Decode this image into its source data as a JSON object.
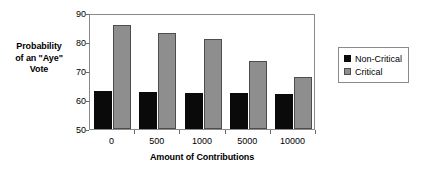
{
  "chart_data": {
    "type": "bar",
    "title": "",
    "xlabel": "Amount of Contributions",
    "ylabel": "Probability of an \"Aye\" Vote",
    "ylabel_lines": [
      "Probability",
      "of an \"Aye\"",
      "Vote"
    ],
    "categories": [
      "0",
      "500",
      "1000",
      "5000",
      "10000"
    ],
    "series": [
      {
        "name": "Non-Critical",
        "color": "#0a0a0a",
        "values": [
          63.0,
          62.8,
          62.5,
          62.4,
          62.2
        ]
      },
      {
        "name": "Critical",
        "color": "#8e8e8e",
        "values": [
          86.0,
          83.0,
          81.0,
          73.6,
          67.8
        ]
      }
    ],
    "ylim": [
      50,
      90
    ],
    "yticks": [
      50,
      60,
      70,
      80,
      90
    ],
    "ytick_labels": [
      "50",
      "60",
      "70",
      "80",
      "90"
    ],
    "grid": false,
    "legend_position": "right"
  },
  "legend": {
    "entries": [
      {
        "label": "Non-Critical"
      },
      {
        "label": "Critical"
      }
    ]
  }
}
